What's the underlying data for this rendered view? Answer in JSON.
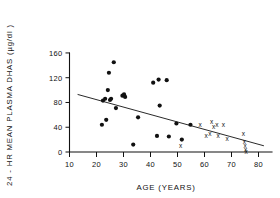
{
  "chart_data": {
    "type": "scatter",
    "title": "",
    "xlabel": "AGE (YEARS)",
    "ylabel": "24 - HR MEAN PLASMA  DHAS (µg/dl )",
    "xlim": [
      5,
      85
    ],
    "ylim": [
      0,
      168
    ],
    "grid": false,
    "legend": null,
    "xticks": [
      10,
      20,
      30,
      40,
      50,
      60,
      70,
      80
    ],
    "xtick_labels": [
      "10",
      "20",
      "30",
      "40",
      "50",
      "60",
      "70",
      "80"
    ],
    "yticks": [
      0,
      40,
      80,
      120,
      160
    ],
    "ytick_labels": [
      "0",
      "40",
      "80",
      "120",
      "160"
    ],
    "series": [
      {
        "name": "filled-circle-subjects",
        "marker": "filled-circle",
        "points": [
          {
            "x": 22.0,
            "y": 44.0
          },
          {
            "x": 22.4,
            "y": 83.0
          },
          {
            "x": 23.2,
            "y": 86.0
          },
          {
            "x": 23.6,
            "y": 52.0
          },
          {
            "x": 24.2,
            "y": 100.0
          },
          {
            "x": 24.6,
            "y": 128.0
          },
          {
            "x": 25.0,
            "y": 84.0
          },
          {
            "x": 25.4,
            "y": 86.0
          },
          {
            "x": 26.4,
            "y": 145.0
          },
          {
            "x": 27.2,
            "y": 71.0
          },
          {
            "x": 29.6,
            "y": 91.0
          },
          {
            "x": 30.2,
            "y": 93.0
          },
          {
            "x": 30.6,
            "y": 89.0
          },
          {
            "x": 33.6,
            "y": 12.0
          },
          {
            "x": 35.4,
            "y": 56.0
          },
          {
            "x": 41.0,
            "y": 112.0
          },
          {
            "x": 42.4,
            "y": 26.0
          },
          {
            "x": 43.0,
            "y": 117.0
          },
          {
            "x": 43.4,
            "y": 75.0
          },
          {
            "x": 46.0,
            "y": 116.0
          },
          {
            "x": 46.8,
            "y": 25.0
          },
          {
            "x": 49.6,
            "y": 46.0
          },
          {
            "x": 51.6,
            "y": 20.0
          },
          {
            "x": 54.8,
            "y": 44.0
          }
        ]
      },
      {
        "name": "cross-subjects",
        "marker": "x",
        "points": [
          {
            "x": 51.2,
            "y": 10.0
          },
          {
            "x": 58.4,
            "y": 44.0
          },
          {
            "x": 60.6,
            "y": 26.0
          },
          {
            "x": 62.0,
            "y": 30.0
          },
          {
            "x": 62.6,
            "y": 49.0
          },
          {
            "x": 63.4,
            "y": 41.0
          },
          {
            "x": 64.6,
            "y": 44.0
          },
          {
            "x": 65.0,
            "y": 26.0
          },
          {
            "x": 67.0,
            "y": 44.0
          },
          {
            "x": 68.4,
            "y": 22.0
          },
          {
            "x": 74.4,
            "y": 30.0
          },
          {
            "x": 74.8,
            "y": 16.0
          },
          {
            "x": 75.0,
            "y": 10.0
          },
          {
            "x": 75.2,
            "y": 4.0
          },
          {
            "x": 75.4,
            "y": 1.0
          }
        ]
      }
    ],
    "regression_line": {
      "x_start": 13.0,
      "y_start": 93.0,
      "x_end": 82.0,
      "y_end": 10.0
    }
  }
}
